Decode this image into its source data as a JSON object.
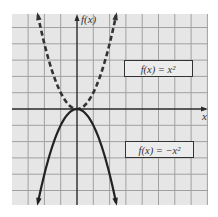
{
  "chart_data": {
    "type": "line",
    "title": "",
    "xlabel": "x",
    "ylabel": "f(x)",
    "xlim": [
      -4,
      8
    ],
    "ylim": [
      -5.9,
      5.8
    ],
    "grid": true,
    "grid_step": 1,
    "legend_position": "inline boxed labels",
    "series": [
      {
        "name": "f(x) = x^2",
        "label": "f(x) = x²",
        "style": "dashed",
        "color": "#333333",
        "x": [
          -2.4,
          -2,
          -1.5,
          -1,
          -0.5,
          0,
          0.5,
          1,
          1.5,
          2,
          2.4
        ],
        "y": [
          5.76,
          4,
          2.25,
          1,
          0.25,
          0,
          0.25,
          1,
          2.25,
          4,
          5.76
        ]
      },
      {
        "name": "f(x) = -x^2",
        "label": "f(x) = −x²",
        "style": "solid",
        "color": "#222222",
        "x": [
          -2.4,
          -2,
          -1.5,
          -1,
          -0.5,
          0,
          0.5,
          1,
          1.5,
          2,
          2.4
        ],
        "y": [
          -5.76,
          -4,
          -2.25,
          -1,
          -0.25,
          0,
          -0.25,
          -1,
          -2.25,
          -4,
          -5.76
        ]
      }
    ],
    "annotations": [
      {
        "text": "f(x) = x²",
        "boxed": true,
        "near_series": "f(x) = x^2"
      },
      {
        "text": "f(x) = −x²",
        "boxed": true,
        "near_series": "f(x) = -x^2"
      }
    ]
  },
  "axes": {
    "x_label": "x",
    "y_label": "f(x)"
  },
  "labels": {
    "upper_equation": "f(x) = x²",
    "lower_equation": "f(x) = −x²"
  },
  "colors": {
    "background": "#e6e6e6",
    "grid": "#a0a0a0",
    "axis": "#2a2a2a",
    "curve": "#2a2a2a"
  }
}
